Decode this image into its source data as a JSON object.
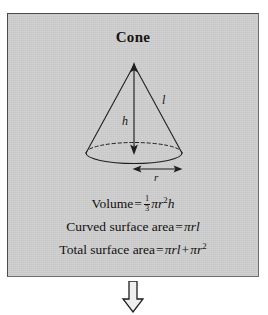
{
  "figure": {
    "title": "Cone",
    "background_color": "#cfcfcf",
    "border_color": "#4a4a4a",
    "ink_color": "#1a1a1a"
  },
  "diagram": {
    "name": "cone-diagram",
    "labels": {
      "height": "h",
      "slant": "l",
      "radius": "r"
    },
    "parts": [
      "apex-point",
      "left-slant-line",
      "right-slant-line",
      "base-ellipse-front-solid",
      "base-ellipse-back-dashed",
      "height-double-arrow",
      "radius-double-arrow"
    ]
  },
  "formulas": [
    {
      "name": "volume",
      "label": "Volume",
      "equals": "=",
      "fraction_numerator": "1",
      "fraction_denominator": "3",
      "pi": "π",
      "radius": "r",
      "radius_exponent": "2",
      "height": "h",
      "plain": "Volume = 1/3 πr²h"
    },
    {
      "name": "curved-surface-area",
      "label": "Curved surface area",
      "equals": "=",
      "pi": "π",
      "radius": "r",
      "slant": "l",
      "plain": "Curved surface area = πrl"
    },
    {
      "name": "total-surface-area",
      "label": "Total surface area",
      "equals": "=",
      "pi": "π",
      "radius": "r",
      "slant": "l",
      "plus": "+",
      "radius_exponent": "2",
      "plain": "Total surface area = πrl + πr²"
    }
  ],
  "flow": {
    "arrow_name": "down-arrow-icon",
    "direction": "down",
    "glyph": "⇓"
  }
}
